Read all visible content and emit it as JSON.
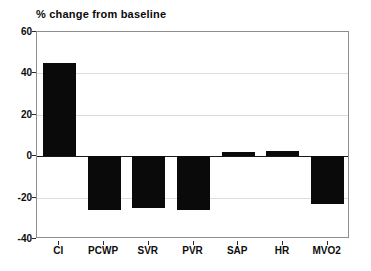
{
  "chart_data": {
    "type": "bar",
    "title": "% change from baseline",
    "xlabel": "",
    "ylabel": "",
    "categories": [
      "CI",
      "PCWP",
      "SVR",
      "PVR",
      "SAP",
      "HR",
      "MVO2"
    ],
    "values": [
      45,
      -26,
      -25,
      -26,
      2,
      2.5,
      -23
    ],
    "ylim": [
      -40,
      60
    ],
    "yticks": [
      60,
      40,
      20,
      0,
      -20,
      -40
    ],
    "ytick_labels": [
      "60",
      "40",
      "20",
      "0",
      "-20",
      "-40"
    ],
    "grid": true,
    "legend": null,
    "bar_color": "#0a0a0a",
    "frame_color": "#8d8d8d",
    "grid_color": "#dcdcdc",
    "zero_line_color": "#1a1a1a",
    "background": "#ffffff"
  }
}
